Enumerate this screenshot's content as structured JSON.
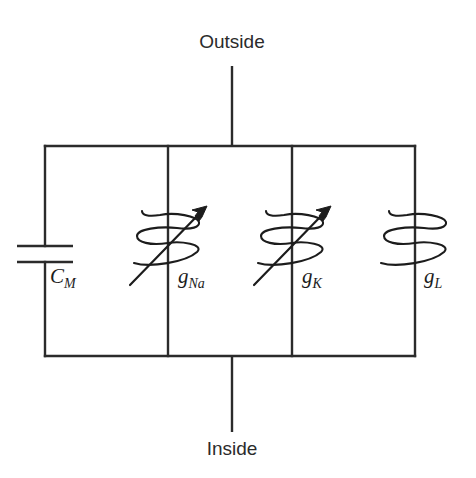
{
  "figure": {
    "background_color": "#ffffff",
    "line_color": "#2b2b2b"
  },
  "terminals": {
    "top": {
      "label": "Outside",
      "x": 232,
      "y": 48
    },
    "bottom": {
      "label": "Inside",
      "x": 232,
      "y": 449
    }
  },
  "branches": [
    {
      "id": "membrane-capacitance",
      "type": "capacitor",
      "variable": false,
      "label_base": "C",
      "label_sub": "M",
      "x": 45,
      "label_x": 50,
      "label_y": 283
    },
    {
      "id": "sodium-conductance",
      "type": "variable-resistor",
      "variable": true,
      "label_base": "g",
      "label_sub": "Na",
      "x": 168,
      "label_x": 178,
      "label_y": 283
    },
    {
      "id": "potassium-conductance",
      "type": "variable-resistor",
      "variable": true,
      "label_base": "g",
      "label_sub": "K",
      "x": 292,
      "label_x": 302,
      "label_y": 283
    },
    {
      "id": "leak-conductance",
      "type": "resistor",
      "variable": false,
      "label_base": "g",
      "label_sub": "L",
      "x": 415,
      "label_x": 424,
      "label_y": 283
    }
  ],
  "rails": {
    "top_y": 146,
    "bottom_y": 356,
    "left_x": 45,
    "right_x": 415
  }
}
